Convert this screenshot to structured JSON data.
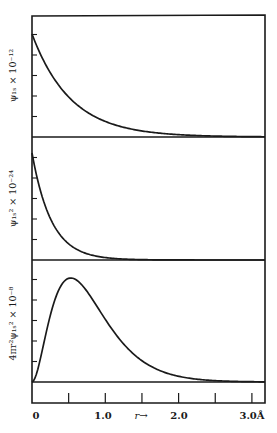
{
  "chart_data": [
    {
      "type": "line",
      "panel": 1,
      "ylabel": "ψ₁ₛ × 10⁻¹²",
      "xlabel": "r →",
      "x_unit": "Å",
      "x": [
        0,
        0.25,
        0.5,
        0.75,
        1.0,
        1.25,
        1.5,
        2.0,
        2.5,
        3.0
      ],
      "values": [
        5.0,
        3.12,
        1.94,
        1.21,
        0.76,
        0.47,
        0.3,
        0.11,
        0.05,
        0.02
      ],
      "ylim": [
        0,
        5
      ],
      "xlim": [
        0,
        3.2
      ],
      "yticks": 5,
      "grid": false
    },
    {
      "type": "line",
      "panel": 2,
      "ylabel": "ψ₁ₛ² × 10⁻²⁴",
      "xlabel": "r →",
      "x_unit": "Å",
      "x": [
        0,
        0.25,
        0.5,
        0.75,
        1.0,
        1.25,
        1.5,
        2.0,
        2.5,
        3.0
      ],
      "values": [
        5.2,
        2.02,
        0.78,
        0.31,
        0.12,
        0.05,
        0.02,
        0.0,
        0.0,
        0.0
      ],
      "ylim": [
        0,
        5
      ],
      "xlim": [
        0,
        3.2
      ],
      "yticks": 5,
      "grid": false
    },
    {
      "type": "line",
      "panel": 3,
      "ylabel": "4πr²ψ₁ₛ² × 10⁻⁸",
      "xlabel": "r →",
      "x_unit": "Å",
      "x": [
        0,
        0.1,
        0.25,
        0.53,
        0.75,
        1.0,
        1.25,
        1.5,
        2.0,
        2.5,
        3.0
      ],
      "values": [
        0,
        1.26,
        3.41,
        5.1,
        4.53,
        3.31,
        2.09,
        1.22,
        0.35,
        0.09,
        0.02
      ],
      "ylim": [
        0,
        5
      ],
      "xlim": [
        0,
        3.2
      ],
      "yticks": 5,
      "grid": false
    }
  ],
  "xaxis": {
    "tick_labels": [
      "0",
      "1.0",
      "2.0",
      "3.0Å"
    ],
    "arrow_label": "r→",
    "minor_tick_step": 0.5
  },
  "panels": [
    {
      "ylabel": "ψ₁ₛ × 10⁻¹²"
    },
    {
      "ylabel": "ψ₁ₛ² × 10⁻²⁴"
    },
    {
      "ylabel": "4πr²ψ₁ₛ² × 10⁻⁸"
    }
  ],
  "colors": {
    "ink": "#1a1a1a",
    "background": "#ffffff"
  }
}
